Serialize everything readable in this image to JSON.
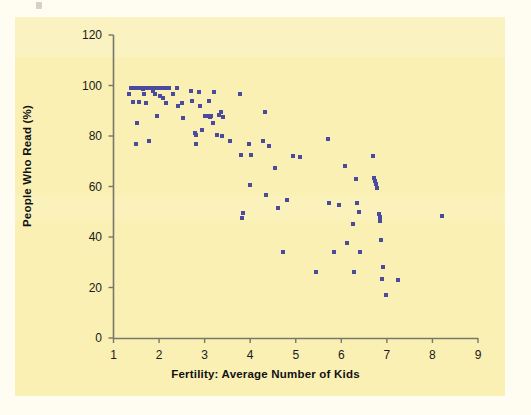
{
  "figure": {
    "background_color": "#fffdf2",
    "panel_color": "#faf0b4",
    "marker_color": "#4a4a9e",
    "axis_color": "#6a6a5a"
  },
  "chart_data": {
    "type": "scatter",
    "title": "",
    "xlabel": "Fertility: Average Number of Kids",
    "ylabel": "People Who Read (%)",
    "xlim": [
      1,
      9
    ],
    "ylim": [
      0,
      120
    ],
    "xticks": [
      1,
      2,
      3,
      4,
      5,
      6,
      7,
      8,
      9
    ],
    "yticks": [
      0,
      20,
      40,
      60,
      80,
      100,
      120
    ],
    "xtick_labels": [
      "1",
      "2",
      "3",
      "4",
      "5",
      "6",
      "7",
      "8",
      "9"
    ],
    "ytick_labels": [
      "0",
      "20",
      "40",
      "60",
      "80",
      "100",
      "120"
    ],
    "grid": false,
    "legend": null,
    "marker": "square",
    "marker_size": 4,
    "n_points": 116,
    "points": [
      [
        1.35,
        96.5
      ],
      [
        1.38,
        99.0
      ],
      [
        1.42,
        93.5
      ],
      [
        1.45,
        99.0
      ],
      [
        1.48,
        99.0
      ],
      [
        1.5,
        77.0
      ],
      [
        1.52,
        85.0
      ],
      [
        1.55,
        99.0
      ],
      [
        1.57,
        93.5
      ],
      [
        1.6,
        99.0
      ],
      [
        1.62,
        99.0
      ],
      [
        1.64,
        98.5
      ],
      [
        1.66,
        96.5
      ],
      [
        1.68,
        99.0
      ],
      [
        1.7,
        99.0
      ],
      [
        1.72,
        93.0
      ],
      [
        1.74,
        99.0
      ],
      [
        1.76,
        99.0
      ],
      [
        1.78,
        78.0
      ],
      [
        1.8,
        99.0
      ],
      [
        1.82,
        99.0
      ],
      [
        1.84,
        99.0
      ],
      [
        1.86,
        98.0
      ],
      [
        1.88,
        99.0
      ],
      [
        1.9,
        96.5
      ],
      [
        1.92,
        99.0
      ],
      [
        1.94,
        99.0
      ],
      [
        1.96,
        88.0
      ],
      [
        1.98,
        99.0
      ],
      [
        2.0,
        99.0
      ],
      [
        2.02,
        96.0
      ],
      [
        2.04,
        99.0
      ],
      [
        2.06,
        99.0
      ],
      [
        2.08,
        95.0
      ],
      [
        2.1,
        99.0
      ],
      [
        2.12,
        99.0
      ],
      [
        2.14,
        99.0
      ],
      [
        2.16,
        93.0
      ],
      [
        2.18,
        99.0
      ],
      [
        2.22,
        99.0
      ],
      [
        2.3,
        96.5
      ],
      [
        2.4,
        99.0
      ],
      [
        2.42,
        92.0
      ],
      [
        2.5,
        93.0
      ],
      [
        2.52,
        87.0
      ],
      [
        2.7,
        98.0
      ],
      [
        2.72,
        94.0
      ],
      [
        2.78,
        81.0
      ],
      [
        2.8,
        80.5
      ],
      [
        2.82,
        77.0
      ],
      [
        2.88,
        97.5
      ],
      [
        2.9,
        92.0
      ],
      [
        2.95,
        82.5
      ],
      [
        3.0,
        88.0
      ],
      [
        3.05,
        88.0
      ],
      [
        3.1,
        94.0
      ],
      [
        3.12,
        87.5
      ],
      [
        3.15,
        88.0
      ],
      [
        3.18,
        85.0
      ],
      [
        3.2,
        97.5
      ],
      [
        3.28,
        80.5
      ],
      [
        3.32,
        88.5
      ],
      [
        3.35,
        89.5
      ],
      [
        3.38,
        80.0
      ],
      [
        3.4,
        87.5
      ],
      [
        3.55,
        78.0
      ],
      [
        3.78,
        96.5
      ],
      [
        3.8,
        72.5
      ],
      [
        3.82,
        47.5
      ],
      [
        3.85,
        49.5
      ],
      [
        3.98,
        77.0
      ],
      [
        4.0,
        60.5
      ],
      [
        4.02,
        72.5
      ],
      [
        4.28,
        78.0
      ],
      [
        4.32,
        89.5
      ],
      [
        4.35,
        56.5
      ],
      [
        4.42,
        76.0
      ],
      [
        4.55,
        67.5
      ],
      [
        4.6,
        51.5
      ],
      [
        4.72,
        34.0
      ],
      [
        4.8,
        54.5
      ],
      [
        4.95,
        72.0
      ],
      [
        5.1,
        71.5
      ],
      [
        5.45,
        26.0
      ],
      [
        5.7,
        79.0
      ],
      [
        5.72,
        53.5
      ],
      [
        5.85,
        34.0
      ],
      [
        5.95,
        52.5
      ],
      [
        6.08,
        68.0
      ],
      [
        6.12,
        37.5
      ],
      [
        6.25,
        45.0
      ],
      [
        6.28,
        26.0
      ],
      [
        6.32,
        63.0
      ],
      [
        6.35,
        53.5
      ],
      [
        6.38,
        50.0
      ],
      [
        6.42,
        34.0
      ],
      [
        6.7,
        72.0
      ],
      [
        6.72,
        63.5
      ],
      [
        6.74,
        62.0
      ],
      [
        6.76,
        61.0
      ],
      [
        6.78,
        59.5
      ],
      [
        6.82,
        49.0
      ],
      [
        6.84,
        48.0
      ],
      [
        6.86,
        46.5
      ],
      [
        6.88,
        39.0
      ],
      [
        6.9,
        23.5
      ],
      [
        6.92,
        28.0
      ],
      [
        6.98,
        17.0
      ],
      [
        7.25,
        23.0
      ],
      [
        8.2,
        48.5
      ]
    ]
  }
}
